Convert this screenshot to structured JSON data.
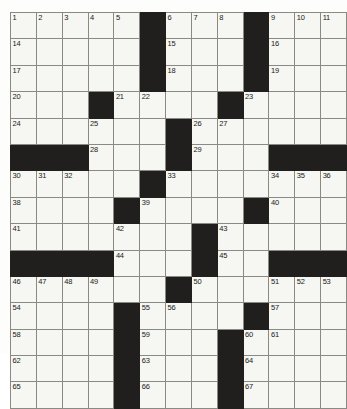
{
  "puzzle": {
    "title": "Crossword Grid",
    "rows": 13,
    "cols": 13,
    "colors": {
      "block": "#201f1d",
      "cell": "#f6f6f2",
      "gridline": "#8a8a85",
      "border": "#55544f",
      "number": "#1a1a18",
      "page": "#fdfdfb"
    },
    "grid": [
      [
        {
          "type": "white",
          "number": "1"
        },
        {
          "type": "white",
          "number": "2"
        },
        {
          "type": "white",
          "number": "3"
        },
        {
          "type": "white",
          "number": "4"
        },
        {
          "type": "white",
          "number": "5"
        },
        {
          "type": "block",
          "number": ""
        },
        {
          "type": "white",
          "number": "6"
        },
        {
          "type": "white",
          "number": "7"
        },
        {
          "type": "white",
          "number": "8"
        },
        {
          "type": "block",
          "number": ""
        },
        {
          "type": "white",
          "number": "9"
        },
        {
          "type": "white",
          "number": "10"
        },
        {
          "type": "white",
          "number": "11"
        },
        {
          "type": "white",
          "number": "12"
        },
        {
          "type": "white",
          "number": "13"
        }
      ],
      [
        {
          "type": "white",
          "number": "14"
        },
        {
          "type": "white",
          "number": ""
        },
        {
          "type": "white",
          "number": ""
        },
        {
          "type": "white",
          "number": ""
        },
        {
          "type": "white",
          "number": ""
        },
        {
          "type": "block",
          "number": ""
        },
        {
          "type": "white",
          "number": "15"
        },
        {
          "type": "white",
          "number": ""
        },
        {
          "type": "white",
          "number": ""
        },
        {
          "type": "block",
          "number": ""
        },
        {
          "type": "white",
          "number": "16"
        },
        {
          "type": "white",
          "number": ""
        },
        {
          "type": "white",
          "number": ""
        },
        {
          "type": "white",
          "number": ""
        },
        {
          "type": "white",
          "number": ""
        }
      ],
      [
        {
          "type": "white",
          "number": "17"
        },
        {
          "type": "white",
          "number": ""
        },
        {
          "type": "white",
          "number": ""
        },
        {
          "type": "white",
          "number": ""
        },
        {
          "type": "white",
          "number": ""
        },
        {
          "type": "block",
          "number": ""
        },
        {
          "type": "white",
          "number": "18"
        },
        {
          "type": "white",
          "number": ""
        },
        {
          "type": "white",
          "number": ""
        },
        {
          "type": "block",
          "number": ""
        },
        {
          "type": "white",
          "number": "19"
        },
        {
          "type": "white",
          "number": ""
        },
        {
          "type": "white",
          "number": ""
        },
        {
          "type": "white",
          "number": ""
        },
        {
          "type": "white",
          "number": ""
        }
      ],
      [
        {
          "type": "white",
          "number": "20"
        },
        {
          "type": "white",
          "number": ""
        },
        {
          "type": "white",
          "number": ""
        },
        {
          "type": "block",
          "number": ""
        },
        {
          "type": "white",
          "number": "21"
        },
        {
          "type": "white",
          "number": "22"
        },
        {
          "type": "white",
          "number": ""
        },
        {
          "type": "white",
          "number": ""
        },
        {
          "type": "block",
          "number": ""
        },
        {
          "type": "white",
          "number": "23"
        },
        {
          "type": "white",
          "number": ""
        },
        {
          "type": "white",
          "number": ""
        },
        {
          "type": "white",
          "number": ""
        },
        {
          "type": "white",
          "number": ""
        }
      ],
      [
        {
          "type": "white",
          "number": "24"
        },
        {
          "type": "white",
          "number": ""
        },
        {
          "type": "white",
          "number": ""
        },
        {
          "type": "white",
          "number": "25"
        },
        {
          "type": "white",
          "number": ""
        },
        {
          "type": "white",
          "number": ""
        },
        {
          "type": "block",
          "number": ""
        },
        {
          "type": "white",
          "number": "26"
        },
        {
          "type": "white",
          "number": "27"
        },
        {
          "type": "white",
          "number": ""
        },
        {
          "type": "white",
          "number": ""
        },
        {
          "type": "white",
          "number": ""
        },
        {
          "type": "white",
          "number": ""
        }
      ],
      [
        {
          "type": "block",
          "number": ""
        },
        {
          "type": "block",
          "number": ""
        },
        {
          "type": "block",
          "number": ""
        },
        {
          "type": "white",
          "number": "28"
        },
        {
          "type": "white",
          "number": ""
        },
        {
          "type": "white",
          "number": ""
        },
        {
          "type": "block",
          "number": ""
        },
        {
          "type": "white",
          "number": "29"
        },
        {
          "type": "white",
          "number": ""
        },
        {
          "type": "white",
          "number": ""
        },
        {
          "type": "block",
          "number": ""
        },
        {
          "type": "block",
          "number": ""
        },
        {
          "type": "block",
          "number": ""
        },
        {
          "type": "block",
          "number": ""
        }
      ],
      [
        {
          "type": "white",
          "number": "30"
        },
        {
          "type": "white",
          "number": "31"
        },
        {
          "type": "white",
          "number": "32"
        },
        {
          "type": "white",
          "number": ""
        },
        {
          "type": "white",
          "number": ""
        },
        {
          "type": "block",
          "number": ""
        },
        {
          "type": "white",
          "number": "33"
        },
        {
          "type": "white",
          "number": ""
        },
        {
          "type": "white",
          "number": ""
        },
        {
          "type": "white",
          "number": ""
        },
        {
          "type": "white",
          "number": "34"
        },
        {
          "type": "white",
          "number": "35"
        },
        {
          "type": "white",
          "number": "36"
        },
        {
          "type": "white",
          "number": "37"
        }
      ],
      [
        {
          "type": "white",
          "number": "38"
        },
        {
          "type": "white",
          "number": ""
        },
        {
          "type": "white",
          "number": ""
        },
        {
          "type": "white",
          "number": ""
        },
        {
          "type": "block",
          "number": ""
        },
        {
          "type": "white",
          "number": "39"
        },
        {
          "type": "white",
          "number": ""
        },
        {
          "type": "white",
          "number": ""
        },
        {
          "type": "white",
          "number": ""
        },
        {
          "type": "block",
          "number": ""
        },
        {
          "type": "white",
          "number": "40"
        },
        {
          "type": "white",
          "number": ""
        },
        {
          "type": "white",
          "number": ""
        },
        {
          "type": "white",
          "number": ""
        }
      ],
      [
        {
          "type": "white",
          "number": "41"
        },
        {
          "type": "white",
          "number": ""
        },
        {
          "type": "white",
          "number": ""
        },
        {
          "type": "white",
          "number": ""
        },
        {
          "type": "white",
          "number": "42"
        },
        {
          "type": "white",
          "number": ""
        },
        {
          "type": "white",
          "number": ""
        },
        {
          "type": "block",
          "number": ""
        },
        {
          "type": "white",
          "number": "43"
        },
        {
          "type": "white",
          "number": ""
        },
        {
          "type": "white",
          "number": ""
        },
        {
          "type": "white",
          "number": ""
        },
        {
          "type": "white",
          "number": ""
        }
      ],
      [
        {
          "type": "block",
          "number": ""
        },
        {
          "type": "block",
          "number": ""
        },
        {
          "type": "block",
          "number": ""
        },
        {
          "type": "block",
          "number": ""
        },
        {
          "type": "white",
          "number": "44"
        },
        {
          "type": "white",
          "number": ""
        },
        {
          "type": "white",
          "number": ""
        },
        {
          "type": "block",
          "number": ""
        },
        {
          "type": "white",
          "number": "45"
        },
        {
          "type": "white",
          "number": ""
        },
        {
          "type": "block",
          "number": ""
        },
        {
          "type": "block",
          "number": ""
        },
        {
          "type": "block",
          "number": ""
        },
        {
          "type": "block",
          "number": ""
        }
      ],
      [
        {
          "type": "white",
          "number": "46"
        },
        {
          "type": "white",
          "number": "47"
        },
        {
          "type": "white",
          "number": "48"
        },
        {
          "type": "white",
          "number": "49"
        },
        {
          "type": "white",
          "number": ""
        },
        {
          "type": "white",
          "number": ""
        },
        {
          "type": "block",
          "number": ""
        },
        {
          "type": "white",
          "number": "50"
        },
        {
          "type": "white",
          "number": ""
        },
        {
          "type": "white",
          "number": ""
        },
        {
          "type": "white",
          "number": "51"
        },
        {
          "type": "white",
          "number": "52"
        },
        {
          "type": "white",
          "number": "53"
        }
      ],
      [
        {
          "type": "white",
          "number": "54"
        },
        {
          "type": "white",
          "number": ""
        },
        {
          "type": "white",
          "number": ""
        },
        {
          "type": "white",
          "number": ""
        },
        {
          "type": "block",
          "number": ""
        },
        {
          "type": "white",
          "number": "55"
        },
        {
          "type": "white",
          "number": "56"
        },
        {
          "type": "white",
          "number": ""
        },
        {
          "type": "white",
          "number": ""
        },
        {
          "type": "block",
          "number": ""
        },
        {
          "type": "white",
          "number": "57"
        },
        {
          "type": "white",
          "number": ""
        },
        {
          "type": "white",
          "number": ""
        },
        {
          "type": "white",
          "number": ""
        }
      ],
      [
        {
          "type": "white",
          "number": "58"
        },
        {
          "type": "white",
          "number": ""
        },
        {
          "type": "white",
          "number": ""
        },
        {
          "type": "white",
          "number": ""
        },
        {
          "type": "block",
          "number": ""
        },
        {
          "type": "white",
          "number": "59"
        },
        {
          "type": "white",
          "number": ""
        },
        {
          "type": "white",
          "number": ""
        },
        {
          "type": "block",
          "number": ""
        },
        {
          "type": "white",
          "number": "60"
        },
        {
          "type": "white",
          "number": "61"
        },
        {
          "type": "white",
          "number": ""
        },
        {
          "type": "white",
          "number": ""
        },
        {
          "type": "white",
          "number": ""
        }
      ],
      [
        {
          "type": "white",
          "number": "62"
        },
        {
          "type": "white",
          "number": ""
        },
        {
          "type": "white",
          "number": ""
        },
        {
          "type": "white",
          "number": ""
        },
        {
          "type": "block",
          "number": ""
        },
        {
          "type": "white",
          "number": "63"
        },
        {
          "type": "white",
          "number": ""
        },
        {
          "type": "white",
          "number": ""
        },
        {
          "type": "block",
          "number": ""
        },
        {
          "type": "white",
          "number": "64"
        },
        {
          "type": "white",
          "number": ""
        },
        {
          "type": "white",
          "number": ""
        },
        {
          "type": "white",
          "number": ""
        },
        {
          "type": "white",
          "number": ""
        }
      ],
      [
        {
          "type": "white",
          "number": "65"
        },
        {
          "type": "white",
          "number": ""
        },
        {
          "type": "white",
          "number": ""
        },
        {
          "type": "white",
          "number": ""
        },
        {
          "type": "block",
          "number": ""
        },
        {
          "type": "white",
          "number": "66"
        },
        {
          "type": "white",
          "number": ""
        },
        {
          "type": "white",
          "number": ""
        },
        {
          "type": "block",
          "number": ""
        },
        {
          "type": "white",
          "number": "67"
        },
        {
          "type": "white",
          "number": ""
        },
        {
          "type": "white",
          "number": ""
        },
        {
          "type": "white",
          "number": ""
        },
        {
          "type": "white",
          "number": ""
        }
      ]
    ]
  }
}
